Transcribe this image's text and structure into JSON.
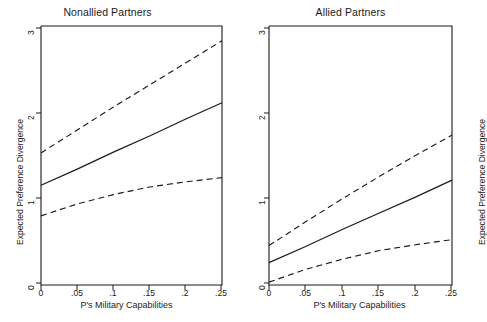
{
  "figure": {
    "background_color": "#ffffff",
    "line_color": "#1b1b1b",
    "panels": [
      {
        "id": "nonallied",
        "title": "Nonallied Partners",
        "xlabel": "P's Military Capabilities",
        "ylabel": "Expected Preference Divergence"
      },
      {
        "id": "allied",
        "title": "Allied Partners",
        "xlabel": "P's Military Capabilities",
        "ylabel": "Expected Preference Divergence"
      }
    ],
    "xticks": [
      "0",
      ".05",
      ".1",
      ".15",
      ".2",
      ".25"
    ],
    "yticks": [
      "0",
      "1",
      "2",
      "3"
    ]
  },
  "chart_data": [
    {
      "type": "line",
      "title": "Nonallied Partners",
      "xlabel": "P's Military Capabilities",
      "ylabel": "Expected Preference Divergence",
      "xlim": [
        0,
        0.25
      ],
      "ylim": [
        0,
        3
      ],
      "xticks": [
        0,
        0.05,
        0.1,
        0.15,
        0.2,
        0.25
      ],
      "xtick_labels": [
        "0",
        ".05",
        ".1",
        ".15",
        ".2",
        ".25"
      ],
      "yticks": [
        0,
        1,
        2,
        3
      ],
      "ytick_labels": [
        "0",
        "1",
        "2",
        "3"
      ],
      "grid": false,
      "legend": "none",
      "x": [
        0,
        0.05,
        0.1,
        0.15,
        0.2,
        0.25
      ],
      "series": [
        {
          "name": "Upper 95% confidence bound",
          "style": "dashed",
          "values": [
            1.53,
            1.8,
            2.07,
            2.33,
            2.59,
            2.85
          ]
        },
        {
          "name": "Predicted expected preference divergence",
          "style": "solid",
          "values": [
            1.15,
            1.34,
            1.54,
            1.73,
            1.93,
            2.12
          ]
        },
        {
          "name": "Lower 95% confidence bound",
          "style": "dashed",
          "values": [
            0.79,
            0.93,
            1.04,
            1.13,
            1.19,
            1.24
          ]
        }
      ]
    },
    {
      "type": "line",
      "title": "Allied Partners",
      "xlabel": "P's Military Capabilities",
      "ylabel": "Expected Preference Divergence",
      "xlim": [
        0,
        0.25
      ],
      "ylim": [
        0,
        3
      ],
      "xticks": [
        0,
        0.05,
        0.1,
        0.15,
        0.2,
        0.25
      ],
      "xtick_labels": [
        "0",
        ".05",
        ".1",
        ".15",
        ".2",
        ".25"
      ],
      "yticks": [
        0,
        1,
        2,
        3
      ],
      "ytick_labels": [
        "0",
        "1",
        "2",
        "3"
      ],
      "grid": false,
      "legend": "none",
      "x": [
        0,
        0.05,
        0.1,
        0.15,
        0.2,
        0.25
      ],
      "series": [
        {
          "name": "Upper 95% confidence bound",
          "style": "dashed",
          "values": [
            0.44,
            0.72,
            0.99,
            1.25,
            1.5,
            1.74
          ]
        },
        {
          "name": "Predicted expected preference divergence",
          "style": "solid",
          "values": [
            0.24,
            0.43,
            0.63,
            0.82,
            1.01,
            1.21
          ]
        },
        {
          "name": "Lower 95% confidence bound",
          "style": "dashed",
          "values": [
            0.01,
            0.16,
            0.28,
            0.38,
            0.45,
            0.51
          ]
        }
      ]
    }
  ]
}
